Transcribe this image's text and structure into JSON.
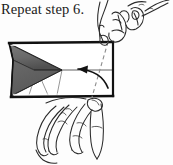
{
  "figure": {
    "caption": "Repeat step 6.",
    "kind": "origami-instruction-diagram",
    "colors": {
      "ink": "#1a1a1a",
      "paper_face": "#ffffff",
      "shaded_face": "#6e6e6e",
      "shaded_face_dark": "#4a4a4a",
      "crease": "#555555",
      "dashed_fold": "#8a8a8a",
      "background": "#fdfdfd"
    },
    "model": {
      "name": "folded-paper-model",
      "top_edge_label": "top-edge",
      "bottom_edge_label": "bottom-edge",
      "right_edge_label": "right-edge",
      "center_crease_label": "center-horizontal-crease",
      "shaded_shape_label": "shaded-chevron-flap",
      "small_crease_triangle_label": "lower-crease-triangle"
    },
    "annotations": {
      "fold_line_label": "dashed-valley-fold-line",
      "fold_line_style": "dashed",
      "action_arrow_label": "curved-fold-arrow",
      "action_arrow_direction": "right-to-left"
    },
    "hands": {
      "upper": {
        "label": "upper-hand",
        "fingers": 3,
        "grip_point": "top-right-corner"
      },
      "lower": {
        "label": "lower-hand",
        "fingers": 4,
        "grip_point": "bottom-edge"
      }
    }
  }
}
